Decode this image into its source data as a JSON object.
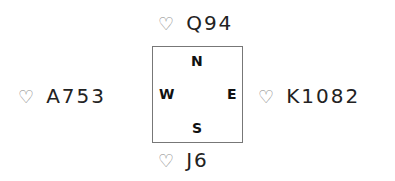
{
  "hands": {
    "north": {
      "suit": "♡",
      "cards": "Q94"
    },
    "west": {
      "suit": "♡",
      "cards": "A753"
    },
    "east": {
      "suit": "♡",
      "cards": "K1082"
    },
    "south": {
      "suit": "♡",
      "cards": "J6"
    }
  },
  "compass": {
    "n": "N",
    "e": "E",
    "s": "S",
    "w": "W"
  }
}
